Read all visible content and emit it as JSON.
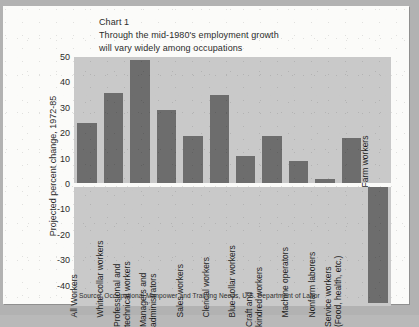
{
  "page": {
    "background_color": "#b2b2b2",
    "card_color": "#fbfbf9"
  },
  "figure": {
    "title_line1": "Chart 1",
    "title_line2": "Through the mid-1980's employment growth",
    "title_line3": "will vary widely among occupations",
    "y_axis_title": "Projected percent change, 1972-85",
    "source": "Source: Occupational Manpower and Training Needs, U.S. Department of Labor",
    "plot_background_color": "#c9c9c9",
    "bar_color": "#6d6d6d",
    "zero_line_color": "#fbfbf9"
  },
  "chart_data": {
    "type": "bar",
    "title": "Through the mid-1980's employment growth will vary widely among occupations",
    "subtitle": "Chart 1",
    "xlabel": "",
    "ylabel": "Projected percent change, 1972-85",
    "ylim": [
      -48,
      50
    ],
    "yticks": [
      50,
      40,
      30,
      20,
      10,
      0,
      -10,
      -20,
      -30,
      -40
    ],
    "ytick_labels": [
      "50",
      "40",
      "30",
      "20",
      "10",
      "0",
      "-10",
      "-20",
      "-30",
      "-40"
    ],
    "grid": false,
    "legend": "none",
    "categories": [
      "All Workers",
      "White-collar workers",
      "Professional and technical workers",
      "Managers and administrators",
      "Sales workers",
      "Clerical workers",
      "Blue-collar workers",
      "Craft and kindred workers",
      "Machine operators",
      "Nonfarm laborers",
      "Service workers (Food, health, etc.)",
      "Farm workers"
    ],
    "category_lines": [
      [
        "All Workers"
      ],
      [
        "White-collar workers"
      ],
      [
        "Professional and",
        "technical workers"
      ],
      [
        "Managers and",
        "administrators"
      ],
      [
        "Sales workers"
      ],
      [
        "Clerical workers"
      ],
      [
        "Blue-collar workers"
      ],
      [
        "Craft and",
        "kindred workers"
      ],
      [
        "Machine operators"
      ],
      [
        "Nonfarm laborers"
      ],
      [
        "Service workers",
        "(Food, health, etc.)"
      ],
      [
        "Farm workers"
      ]
    ],
    "values": [
      24,
      36,
      49,
      29,
      19,
      35,
      11,
      19,
      9,
      2,
      18,
      -47
    ],
    "source": "Source: Occupational Manpower and Training Needs, U.S. Department of Labor"
  }
}
